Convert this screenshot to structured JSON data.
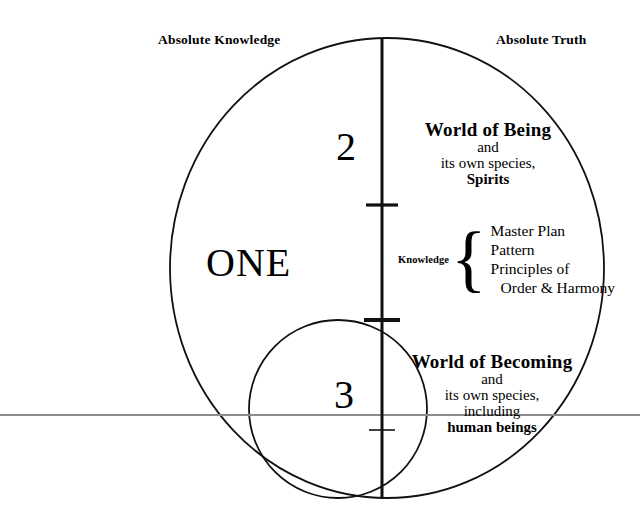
{
  "diagram": {
    "title_hidden": "",
    "labels": {
      "absolute_knowledge": "Absolute Knowledge",
      "absolute_truth": "Absolute Truth",
      "one": "ONE",
      "numeral_upper": "2",
      "numeral_lower": "3"
    },
    "world_of_being": {
      "title": "World of Being",
      "line2": "and",
      "line3": "its own species,",
      "line4": "Spirits"
    },
    "world_of_becoming": {
      "title": "World of Becoming",
      "line2": "and",
      "line3": "its own species,",
      "line4": "including",
      "line5": "human beings"
    },
    "knowledge": {
      "label": "Knowledge",
      "brace": "{",
      "items": [
        "Master Plan",
        "Pattern",
        "Principles of",
        "Order & Harmony"
      ]
    },
    "colors": {
      "ink": "#000000",
      "background": "#ffffff",
      "horizon_line": "#8c8c8c"
    },
    "geometry": {
      "outer_circle": {
        "cx": 387,
        "cy": 268,
        "rx": 217,
        "ry": 230
      },
      "inner_circle": {
        "cx": 338,
        "cy": 409,
        "r": 89
      },
      "axis": {
        "x": 382,
        "y_top": 38,
        "y_bottom": 499
      },
      "ticks": [
        {
          "y": 205,
          "half_width": 16,
          "thickness": 3
        },
        {
          "y": 320,
          "half_width": 18,
          "thickness": 4
        },
        {
          "y": 430,
          "half_width": 13,
          "thickness": 1.5
        }
      ],
      "horizon_y": 415
    }
  }
}
